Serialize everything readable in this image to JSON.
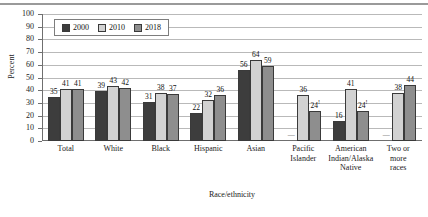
{
  "chart_data": {
    "type": "bar",
    "title": "",
    "xlabel": "Race/ethnicity",
    "ylabel": "Percent",
    "ylim": [
      0,
      100
    ],
    "yticks": [
      0,
      10,
      20,
      30,
      40,
      50,
      60,
      70,
      80,
      90,
      100
    ],
    "grid": true,
    "legend_position": "top-left inside",
    "categories": [
      "Total",
      "White",
      "Black",
      "Hispanic",
      "Asian",
      "Pacific Islander",
      "American Indian/Alaska Native",
      "Two or more races"
    ],
    "category_lines": [
      [
        "Total"
      ],
      [
        "White"
      ],
      [
        "Black"
      ],
      [
        "Hispanic"
      ],
      [
        "Asian"
      ],
      [
        "Pacific",
        "Islander"
      ],
      [
        "American",
        "Indian/Alaska",
        "Native"
      ],
      [
        "Two or",
        "more",
        "races"
      ]
    ],
    "series": [
      {
        "name": "2000",
        "color": "#3d3d3d",
        "values": [
          35,
          39,
          31,
          22,
          56,
          null,
          16,
          null
        ],
        "labels": [
          "35",
          "39",
          "31",
          "22",
          "56",
          "—",
          "16",
          "—"
        ]
      },
      {
        "name": "2010",
        "color": "#d2d2d2",
        "values": [
          41,
          43,
          38,
          32,
          64,
          36,
          41,
          38
        ],
        "labels": [
          "41",
          "43",
          "38",
          "32",
          "64",
          "36",
          "41",
          "38"
        ]
      },
      {
        "name": "2018",
        "color": "#8e8e8e",
        "values": [
          41,
          42,
          37,
          36,
          59,
          24,
          24,
          44
        ],
        "labels": [
          "41",
          "42",
          "37",
          "36",
          "59",
          "24",
          "24",
          "44"
        ],
        "flagged": [
          false,
          false,
          false,
          false,
          false,
          true,
          true,
          false
        ]
      }
    ]
  },
  "legend": {
    "items": [
      {
        "label": "2000",
        "color": "#3d3d3d"
      },
      {
        "label": "2010",
        "color": "#d2d2d2"
      },
      {
        "label": "2018",
        "color": "#8e8e8e"
      }
    ]
  },
  "axes": {
    "y_title": "Percent",
    "x_title": "Race/ethnicity",
    "y_tick_labels": [
      "100",
      "90",
      "80",
      "70",
      "60",
      "50",
      "40",
      "30",
      "20",
      "10",
      "0"
    ]
  }
}
